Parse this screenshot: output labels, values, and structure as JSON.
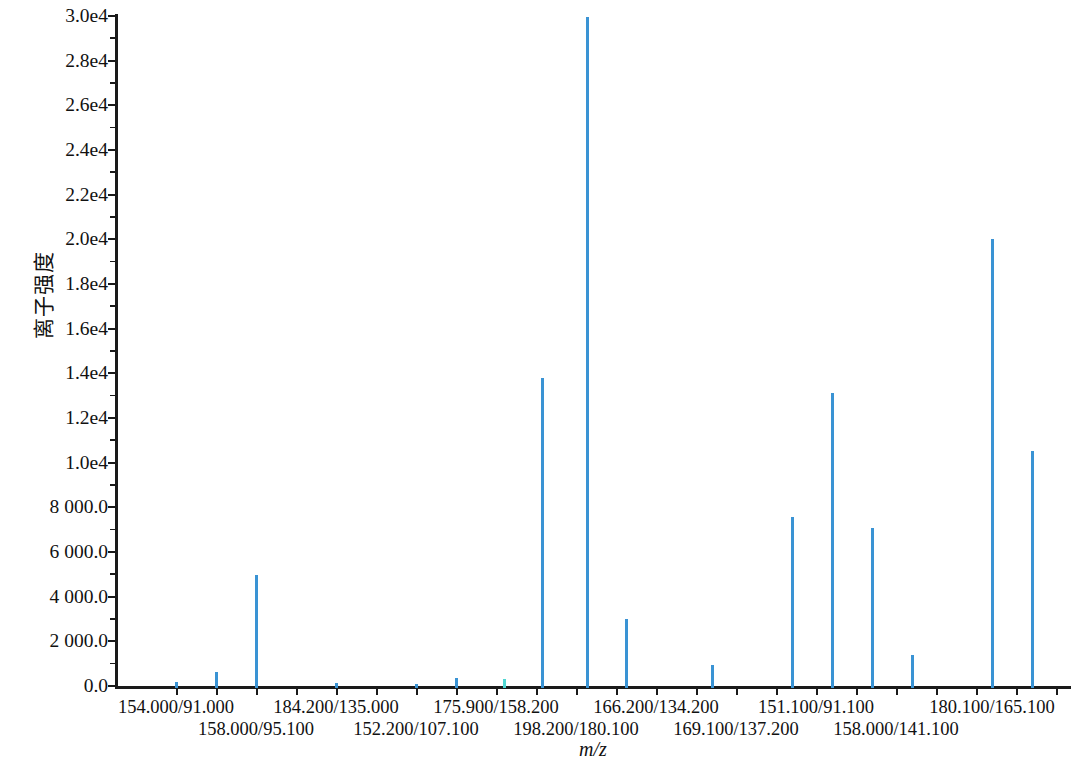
{
  "chart_data": {
    "type": "bar",
    "title": "",
    "xlabel": "m/z",
    "ylabel": "离子强度",
    "ylim": [
      0,
      30000
    ],
    "grid": false,
    "legend": null,
    "y_ticks": [
      {
        "value": 30000,
        "label": "3.0e4"
      },
      {
        "value": 28000,
        "label": "2.8e4"
      },
      {
        "value": 26000,
        "label": "2.6e4"
      },
      {
        "value": 24000,
        "label": "2.4e4"
      },
      {
        "value": 22000,
        "label": "2.2e4"
      },
      {
        "value": 20000,
        "label": "2.0e4"
      },
      {
        "value": 18000,
        "label": "1.8e4"
      },
      {
        "value": 16000,
        "label": "1.6e4"
      },
      {
        "value": 14000,
        "label": "1.4e4"
      },
      {
        "value": 12000,
        "label": "1.2e4"
      },
      {
        "value": 10000,
        "label": "1.0e4"
      },
      {
        "value": 8000,
        "label": "8 000.0"
      },
      {
        "value": 6000,
        "label": "6 000.0"
      },
      {
        "value": 4000,
        "label": "4 000.0"
      },
      {
        "value": 2000,
        "label": "2 000.0"
      },
      {
        "value": 0,
        "label": "0.0"
      }
    ],
    "categories": [
      "154.000/91.000",
      "158.000/95.100",
      "184.200/135.000",
      "152.200/107.100",
      "175.900/158.200",
      "198.200/180.100",
      "166.200/134.200",
      "169.100/137.200",
      "151.100/91.100",
      "158.000/141.100",
      "180.100/165.100"
    ],
    "tick_positions_px": [
      176,
      216,
      256,
      296,
      336,
      376,
      416,
      456,
      496,
      536,
      576,
      616,
      656,
      696,
      736,
      776,
      816,
      856,
      896,
      936,
      976,
      1016,
      1056
    ],
    "category_label_positions_px": [
      176,
      256,
      336,
      416,
      496,
      576,
      656,
      736,
      816,
      896,
      992
    ],
    "peaks": [
      {
        "x_px": 176,
        "value": 290,
        "color": "#3a93d4"
      },
      {
        "x_px": 216,
        "value": 700,
        "color": "#3a93d4"
      },
      {
        "x_px": 256,
        "value": 5060,
        "color": "#3a93d4"
      },
      {
        "x_px": 336,
        "value": 230,
        "color": "#3a93d4"
      },
      {
        "x_px": 416,
        "value": 200,
        "color": "#3a93d4"
      },
      {
        "x_px": 456,
        "value": 450,
        "color": "#3a93d4"
      },
      {
        "x_px": 504,
        "value": 390,
        "color": "#4fd6d2"
      },
      {
        "x_px": 542,
        "value": 13900,
        "color": "#3a93d4"
      },
      {
        "x_px": 587,
        "value": 30050,
        "color": "#3a93d4"
      },
      {
        "x_px": 626,
        "value": 3080,
        "color": "#3a93d4"
      },
      {
        "x_px": 712,
        "value": 1050,
        "color": "#3a93d4"
      },
      {
        "x_px": 792,
        "value": 7650,
        "color": "#3a93d4"
      },
      {
        "x_px": 832,
        "value": 13200,
        "color": "#3a93d4"
      },
      {
        "x_px": 872,
        "value": 7150,
        "color": "#3a93d4"
      },
      {
        "x_px": 912,
        "value": 1500,
        "color": "#3a93d4"
      },
      {
        "x_px": 992,
        "value": 20100,
        "color": "#3a93d4"
      },
      {
        "x_px": 1032,
        "value": 10600,
        "color": "#3a93d4"
      }
    ],
    "colors": {
      "peak_primary": "#3a93d4",
      "peak_secondary": "#4fd6d2",
      "axis": "#1a1a1a",
      "background": "#ffffff"
    }
  }
}
